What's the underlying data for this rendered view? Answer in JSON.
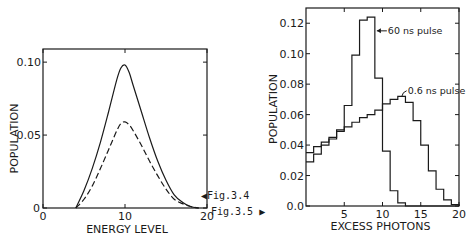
{
  "figure_refs": {
    "fig34": "Fig.3.4",
    "fig35": "Fig.3.5"
  },
  "chart_data": [
    {
      "type": "line",
      "title": "",
      "xlabel": "ENERGY   LEVEL",
      "ylabel": "POPULATION",
      "xlim": [
        0,
        20
      ],
      "ylim": [
        0,
        0.11
      ],
      "x_ticks": [
        0,
        10,
        20
      ],
      "x_tick_labels": [
        "0",
        "10",
        "20"
      ],
      "y_ticks": [
        0,
        0.05,
        0.1
      ],
      "y_tick_labels": [
        "0",
        "0.05",
        "0.10"
      ],
      "grid": false,
      "legend": null,
      "series": [
        {
          "name": "solid curve",
          "style": "solid",
          "x": [
            4,
            5,
            6,
            7,
            8,
            9,
            9.5,
            10,
            10.5,
            11,
            12,
            13,
            14,
            15,
            16,
            17,
            18,
            19
          ],
          "values": [
            0.0,
            0.012,
            0.027,
            0.045,
            0.066,
            0.088,
            0.096,
            0.098,
            0.093,
            0.084,
            0.066,
            0.048,
            0.032,
            0.019,
            0.009,
            0.004,
            0.001,
            0.0
          ]
        },
        {
          "name": "dashed curve",
          "style": "dashed",
          "x": [
            4,
            5,
            6,
            7,
            8,
            9,
            9.5,
            10,
            10.5,
            11,
            12,
            13,
            14,
            15,
            16,
            17,
            18,
            19
          ],
          "values": [
            0.0,
            0.006,
            0.015,
            0.027,
            0.04,
            0.053,
            0.058,
            0.059,
            0.057,
            0.053,
            0.043,
            0.032,
            0.022,
            0.013,
            0.006,
            0.003,
            0.001,
            0.0
          ]
        }
      ]
    },
    {
      "type": "bar",
      "subtype": "step-histogram",
      "title": "",
      "xlabel": "EXCESS   PHOTONS",
      "ylabel": "POPULATION",
      "xlim": [
        0,
        20
      ],
      "ylim": [
        0,
        0.13
      ],
      "x_ticks": [
        5,
        10,
        15,
        20
      ],
      "x_tick_labels": [
        "5",
        "10",
        "15",
        "20"
      ],
      "y_ticks": [
        0.0,
        0.02,
        0.04,
        0.06,
        0.08,
        0.1,
        0.12
      ],
      "y_tick_labels": [
        "0.0",
        "0.02",
        "0.04",
        "0.06",
        "0.08",
        "0.10",
        "0.12"
      ],
      "grid": false,
      "categories": [
        1,
        2,
        3,
        4,
        5,
        6,
        7,
        8,
        9,
        10,
        11,
        12,
        13,
        14,
        15,
        16,
        17,
        18,
        19,
        20
      ],
      "series": [
        {
          "name": "60 ns pulse",
          "values": [
            0.029,
            0.034,
            0.04,
            0.044,
            0.05,
            0.066,
            0.099,
            0.122,
            0.124,
            0.084,
            0.036,
            0.01,
            0.002,
            0.0,
            0.0,
            0.0,
            0.0,
            0.0,
            0.0,
            0.0
          ]
        },
        {
          "name": "0.6 ns pulse",
          "values": [
            0.035,
            0.039,
            0.042,
            0.045,
            0.049,
            0.052,
            0.055,
            0.058,
            0.06,
            0.063,
            0.067,
            0.07,
            0.072,
            0.068,
            0.056,
            0.04,
            0.023,
            0.011,
            0.004,
            0.001
          ]
        }
      ],
      "annotations": [
        "60 ns pulse",
        "0.6 ns pulse"
      ]
    }
  ]
}
